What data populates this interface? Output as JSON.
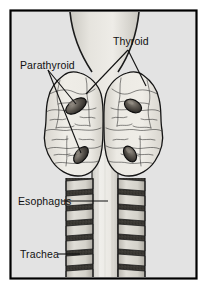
{
  "figure": {
    "kind": "anatomical-illustration",
    "border_color": "#000000",
    "background_color": "#e3e3e3",
    "page_color": "#ffffff",
    "ink_color": "#111111"
  },
  "labels": {
    "parathyroid": "Parathyroid",
    "thyroid": "Thyroid",
    "esophagus": "Esophagus",
    "trachea": "Trachea"
  },
  "structures": {
    "thyroid_lobes": 2,
    "parathyroid_glands": 4,
    "trachea_tubes": 2,
    "esophagus_columns": 1
  },
  "colors": {
    "gland_fill": "#eceae4",
    "gland_stroke": "#1a1a1a",
    "parathyroid_fill": "#4a4540",
    "parathyroid_stroke": "#111111",
    "trachea_ring_fill": "#d2d0c9",
    "trachea_gap_fill": "#3a3833",
    "esophagus_fill": "#efeeea",
    "neck_shade": "#cfcdc7"
  }
}
